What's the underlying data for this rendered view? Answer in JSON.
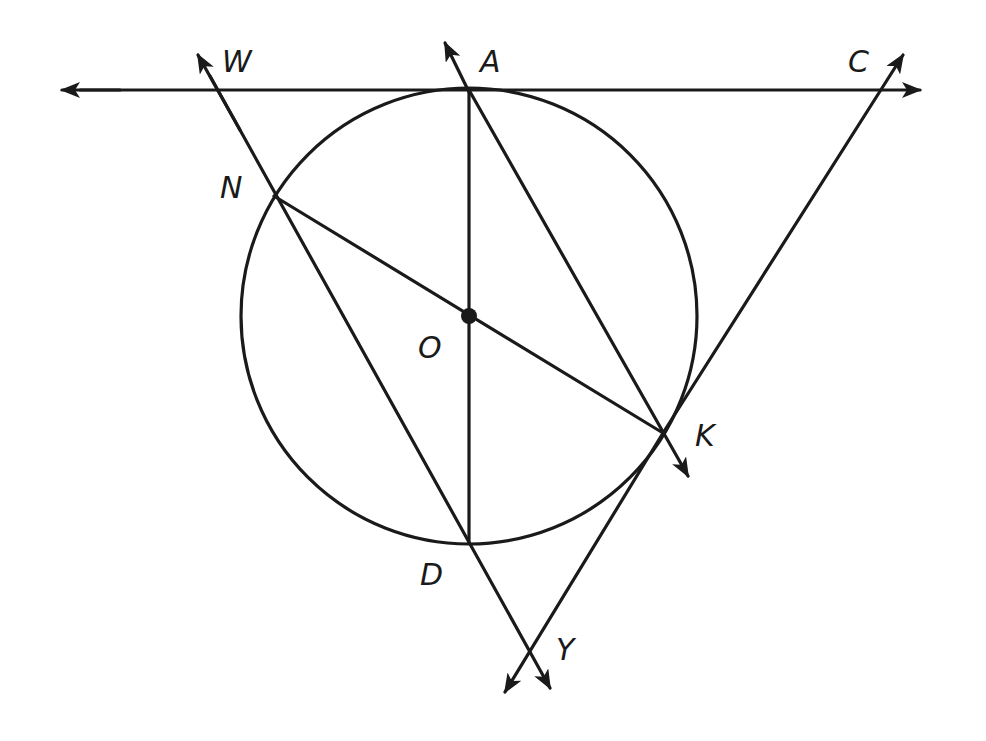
{
  "diagram": {
    "type": "geometry-circle-tangents",
    "stroke_color": "#1a1a1a",
    "background": "#ffffff",
    "circle": {
      "center_label": "O",
      "cx": 469,
      "cy": 316,
      "r": 228
    },
    "points": {
      "A": {
        "label": "A",
        "x": 469,
        "y": 90
      },
      "C": {
        "label": "C",
        "x": 890,
        "y": 62
      },
      "W": {
        "label": "W",
        "x": 200,
        "y": 58
      },
      "N": {
        "label": "N",
        "x": 274,
        "y": 196
      },
      "O": {
        "label": "O",
        "x": 469,
        "y": 316
      },
      "K": {
        "label": "K",
        "x": 663,
        "y": 433
      },
      "D": {
        "label": "D",
        "x": 469,
        "y": 543
      },
      "Y": {
        "label": "Y",
        "x": 532,
        "y": 650
      }
    },
    "labels": [
      {
        "id": "W",
        "text": "W",
        "x": 222,
        "y": 72
      },
      {
        "id": "A",
        "text": "A",
        "x": 480,
        "y": 72
      },
      {
        "id": "C",
        "text": "C",
        "x": 848,
        "y": 72
      },
      {
        "id": "N",
        "text": "N",
        "x": 220,
        "y": 198
      },
      {
        "id": "O",
        "text": "O",
        "x": 418,
        "y": 358
      },
      {
        "id": "K",
        "text": "K",
        "x": 695,
        "y": 446
      },
      {
        "id": "D",
        "text": "D",
        "x": 420,
        "y": 585
      },
      {
        "id": "Y",
        "text": "Y",
        "x": 556,
        "y": 660
      }
    ],
    "segments": [
      {
        "name": "tangent-line-at-A",
        "from": "left-arrow",
        "to": "right-arrow"
      },
      {
        "name": "line-W-N-D-Y",
        "passes": [
          "W",
          "N",
          "D",
          "Y"
        ]
      },
      {
        "name": "line-A-K",
        "passes": [
          "A",
          "K"
        ]
      },
      {
        "name": "diameter-A-D",
        "passes": [
          "A",
          "O",
          "D"
        ]
      },
      {
        "name": "diameter-N-K",
        "passes": [
          "N",
          "O",
          "K"
        ]
      },
      {
        "name": "tangent-line-at-K",
        "passes": [
          "C",
          "K",
          "Y"
        ]
      }
    ]
  }
}
